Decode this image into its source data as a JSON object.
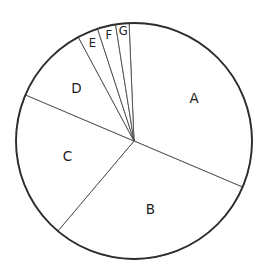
{
  "chart_data": {
    "type": "pie",
    "title": "",
    "subtitle": "",
    "xlabel": "",
    "ylabel": "",
    "grid": false,
    "legend": "none",
    "labels_on_slices": true,
    "start_angle_deg": 92.4,
    "direction": "clockwise",
    "categories": [
      "A",
      "B",
      "C",
      "D",
      "E",
      "F",
      "G"
    ],
    "values": [
      32.1,
      29.8,
      20.2,
      10.8,
      2.8,
      2.5,
      1.8
    ],
    "angles_deg": [
      115.4,
      107.2,
      72.8,
      38.8,
      10.2,
      9.0,
      6.6
    ],
    "slices": [
      {
        "label": "A",
        "value": 32.1,
        "angle_deg": 115.4,
        "start_deg": -23.0,
        "end_deg": 92.4,
        "color": "#ffffff"
      },
      {
        "label": "B",
        "value": 29.8,
        "angle_deg": 107.2,
        "start_deg": 229.8,
        "end_deg": 337.0,
        "color": "#ffffff"
      },
      {
        "label": "C",
        "value": 20.2,
        "angle_deg": 72.8,
        "start_deg": 157.0,
        "end_deg": 229.8,
        "color": "#ffffff"
      },
      {
        "label": "D",
        "value": 10.8,
        "angle_deg": 38.8,
        "start_deg": 118.2,
        "end_deg": 157.0,
        "color": "#ffffff"
      },
      {
        "label": "E",
        "value": 2.8,
        "angle_deg": 10.2,
        "start_deg": 108.0,
        "end_deg": 118.2,
        "color": "#ffffff"
      },
      {
        "label": "F",
        "value": 2.5,
        "angle_deg": 9.0,
        "start_deg": 99.0,
        "end_deg": 108.0,
        "color": "#ffffff"
      },
      {
        "label": "G",
        "value": 1.8,
        "angle_deg": 6.6,
        "start_deg": 92.4,
        "end_deg": 99.0,
        "color": "#ffffff"
      }
    ],
    "geometry": {
      "center_x": 134,
      "center_y": 141,
      "radius": 118
    },
    "style": {
      "fill_color": "#ffffff",
      "outline_color": "#2e2e2e",
      "divider_color": "#4a4a4a",
      "label_color": "#1d1d1d",
      "background": "#ffffff"
    }
  },
  "labels": {
    "a": "A",
    "b": "B",
    "c": "C",
    "d": "D",
    "e": "E",
    "f": "F",
    "g": "G"
  }
}
